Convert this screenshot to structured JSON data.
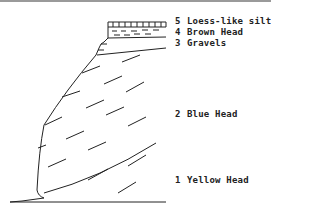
{
  "diagram": {
    "type": "geological-section",
    "layers": [
      {
        "number": "5",
        "name": "Loess-like silts"
      },
      {
        "number": "4",
        "name": "Brown Head"
      },
      {
        "number": "3",
        "name": "Gravels"
      },
      {
        "number": "2",
        "name": "Blue Head"
      },
      {
        "number": "1",
        "name": "Yellow Head"
      }
    ],
    "colors": {
      "line": "#222222",
      "background": "#ffffff"
    }
  }
}
